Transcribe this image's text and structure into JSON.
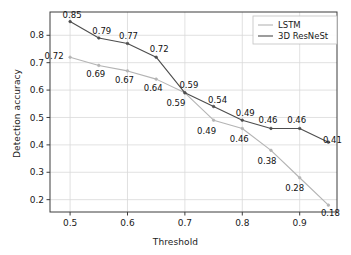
{
  "chart_data": {
    "type": "line",
    "title": "",
    "xlabel": "Threshold",
    "ylabel": "Detection accuracy",
    "xlim": [
      0.465,
      0.965
    ],
    "ylim": [
      0.155,
      0.885
    ],
    "xticks": [
      "0.5",
      "0.6",
      "0.7",
      "0.8",
      "0.9"
    ],
    "xtick_values": [
      0.5,
      0.6,
      0.7,
      0.8,
      0.9
    ],
    "yticks": [
      "0.2",
      "0.3",
      "0.4",
      "0.5",
      "0.6",
      "0.7",
      "0.8"
    ],
    "ytick_values": [
      0.2,
      0.3,
      0.4,
      0.5,
      0.6,
      0.7,
      0.8
    ],
    "grid": true,
    "legend_position": "upper right",
    "x": [
      0.5,
      0.55,
      0.6,
      0.65,
      0.7,
      0.75,
      0.8,
      0.85,
      0.9,
      0.95
    ],
    "series": [
      {
        "name": "LSTM",
        "color": "#b4b4b4",
        "values": [
          0.72,
          0.69,
          0.67,
          0.64,
          0.59,
          0.49,
          0.46,
          0.38,
          0.28,
          0.18
        ],
        "labels": [
          "0.72",
          "0.69",
          "0.67",
          "0.64",
          "0.59",
          "0.49",
          "0.46",
          "0.38",
          "0.28",
          "0.18"
        ]
      },
      {
        "name": "3D ResNeSt",
        "color": "#4d4d4d",
        "values": [
          0.85,
          0.79,
          0.77,
          0.72,
          0.59,
          0.54,
          0.49,
          0.46,
          0.46,
          0.41
        ],
        "labels": [
          "0.85",
          "0.79",
          "0.77",
          "0.72",
          "0.59",
          "0.54",
          "0.49",
          "0.46",
          "0.46",
          "0.41"
        ]
      }
    ]
  },
  "legend": {
    "entries": [
      {
        "label": "LSTM"
      },
      {
        "label": "3D ResNeSt"
      }
    ]
  },
  "axes": {
    "x_title": "Threshold",
    "y_title": "Detection accuracy"
  },
  "colors": {
    "lstm": "#b4b4b4",
    "resnest": "#4d4d4d",
    "grid": "#d9d9d9",
    "axis": "#3c3c3c",
    "background": "#ffffff"
  }
}
